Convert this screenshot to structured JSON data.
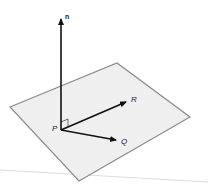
{
  "figure": {
    "colors": {
      "background": "#ffffff",
      "plane_fill": "#efefef",
      "plane_edge": "#8a8a8a",
      "vector": "#111111",
      "baseline": "#dcdcdc"
    },
    "plane": {
      "corners": [
        [
          10,
          107
        ],
        [
          117,
          63
        ],
        [
          190,
          117
        ],
        [
          79,
          181
        ]
      ]
    },
    "points": {
      "P": {
        "label": "P",
        "x": 61,
        "y": 130
      },
      "n": {
        "label": "n",
        "x": 61,
        "y": 15
      },
      "R": {
        "label": "R",
        "x": 129,
        "y": 100
      },
      "Q": {
        "label": "Q",
        "x": 120,
        "y": 141
      }
    },
    "vectors": [
      {
        "from": "P",
        "to": "n"
      },
      {
        "from": "P",
        "to": "R"
      },
      {
        "from": "P",
        "to": "Q"
      }
    ],
    "right_angle_marker": {
      "at": "P"
    }
  }
}
